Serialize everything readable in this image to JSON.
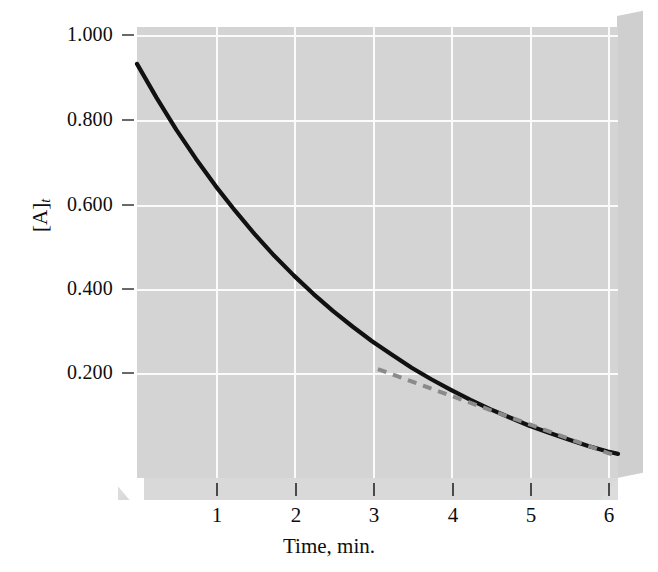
{
  "chart_data": {
    "type": "line",
    "title": "",
    "xlabel": "Time, min.",
    "ylabel": "[A]",
    "ylabel_subscript": "t",
    "xlim": [
      0,
      6.13
    ],
    "ylim": [
      0.1005,
      1.08
    ],
    "xticks": [
      1,
      2,
      3,
      4,
      5,
      6
    ],
    "xtick_labels": [
      "1",
      "2",
      "3",
      "4",
      "5",
      "6"
    ],
    "yticks": [
      1.0,
      0.8,
      0.6,
      0.4,
      0.2
    ],
    "ytick_labels": [
      "1.000",
      "0.800",
      "0.600",
      "0.400",
      "0.200"
    ],
    "grid": true,
    "legend": "none",
    "background": "#d4d4d4",
    "series": [
      {
        "name": "concentration-decay-curve",
        "style": "solid",
        "color": "#111111",
        "x": [
          0,
          0.25,
          0.5,
          0.75,
          1,
          1.25,
          1.5,
          1.75,
          2,
          2.25,
          2.5,
          2.75,
          3,
          3.25,
          3.5,
          3.75,
          4,
          4.25,
          4.5,
          4.75,
          5,
          5.25,
          5.5,
          5.75,
          6,
          6.13
        ],
        "y": [
          1.0,
          0.926,
          0.857,
          0.794,
          0.735,
          0.681,
          0.63,
          0.583,
          0.54,
          0.5,
          0.463,
          0.429,
          0.397,
          0.368,
          0.34,
          0.315,
          0.292,
          0.27,
          0.25,
          0.232,
          0.214,
          0.199,
          0.184,
          0.17,
          0.158,
          0.153
        ]
      },
      {
        "name": "tangent-line-at-t3",
        "style": "dashed",
        "color": "#8a8a8a",
        "x": [
          3.07,
          6.13
        ],
        "y": [
          0.337,
          0.147
        ]
      }
    ]
  },
  "figure": {
    "panel_face_color": "#d4d4d4",
    "panel_side_color": "#cfcfcf",
    "panel_base_color": "#dcdcdc",
    "gridline_color": "#fbfbfb",
    "curve_color": "#111111",
    "tangent_color": "#8a8a8a"
  }
}
